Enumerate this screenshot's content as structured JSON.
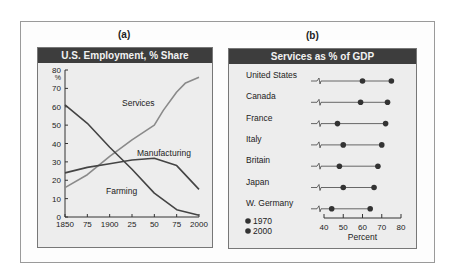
{
  "panel_a": {
    "label": "(a)",
    "title": "U.S. Employment, % Share"
  },
  "panel_b": {
    "label": "(b)",
    "title": "Services as % of GDP"
  },
  "colors": {
    "header_bg": "#3d3d3d",
    "panel_bg": "#ededed",
    "services_line": "#8a8a8a",
    "dark_line": "#444444",
    "dot": "#333333"
  },
  "chart_data": [
    {
      "type": "line",
      "title": "U.S. Employment, % Share",
      "xlabel": "",
      "ylabel": "%",
      "x": [
        1850,
        1875,
        1900,
        1910,
        1925,
        1950,
        1960,
        1975,
        1985,
        2000
      ],
      "x_tick_labels": [
        "1850",
        "75",
        "1900",
        "25",
        "50",
        "75",
        "2000"
      ],
      "x_ticks": [
        1850,
        1875,
        1900,
        1925,
        1950,
        1975,
        2000
      ],
      "y_ticks": [
        0,
        10,
        20,
        30,
        40,
        50,
        60,
        70,
        80
      ],
      "ylim": [
        0,
        80
      ],
      "xlim": [
        1850,
        2000
      ],
      "grid": false,
      "series": [
        {
          "name": "Services",
          "points": [
            [
              1850,
              16
            ],
            [
              1875,
              23
            ],
            [
              1900,
              33
            ],
            [
              1925,
              42
            ],
            [
              1950,
              50
            ],
            [
              1960,
              58
            ],
            [
              1975,
              68
            ],
            [
              1985,
              73
            ],
            [
              2000,
              76
            ]
          ]
        },
        {
          "name": "Manufacturing",
          "points": [
            [
              1850,
              24
            ],
            [
              1875,
              27
            ],
            [
              1900,
              29
            ],
            [
              1925,
              31
            ],
            [
              1950,
              32
            ],
            [
              1975,
              28
            ],
            [
              2000,
              15
            ]
          ]
        },
        {
          "name": "Farming",
          "points": [
            [
              1850,
              61
            ],
            [
              1875,
              51
            ],
            [
              1900,
              38
            ],
            [
              1925,
              26
            ],
            [
              1950,
              13
            ],
            [
              1975,
              4
            ],
            [
              2000,
              1
            ]
          ]
        }
      ],
      "annotations": [
        "Services",
        "Manufacturing",
        "Farming"
      ]
    },
    {
      "type": "dumbbell",
      "title": "Services as % of GDP",
      "xlabel": "Percent",
      "xlim": [
        40,
        80
      ],
      "x_ticks": [
        40,
        50,
        60,
        70,
        80
      ],
      "axis_break": true,
      "legend": [
        "1970",
        "2000"
      ],
      "legend_position": "bottom-left",
      "categories": [
        "United States",
        "Canada",
        "France",
        "Italy",
        "Britain",
        "Japan",
        "W. Germany"
      ],
      "series": [
        {
          "name": "1970",
          "values": [
            60,
            59,
            47,
            50,
            48,
            50,
            44
          ]
        },
        {
          "name": "2000",
          "values": [
            75,
            73,
            72,
            70,
            68,
            66,
            64
          ]
        }
      ]
    }
  ]
}
